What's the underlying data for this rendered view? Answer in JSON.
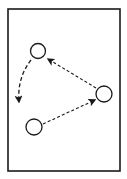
{
  "diagram": {
    "type": "cycle",
    "background": "#ffffff",
    "stroke_color": "#1a1a1a",
    "frame": {
      "x": 8,
      "y": 9,
      "width": 112,
      "height": 162,
      "stroke_width": 1.6
    },
    "nodes": [
      {
        "id": "node-top-left",
        "cx": 38,
        "cy": 51,
        "r": 7.5
      },
      {
        "id": "node-right",
        "cx": 104,
        "cy": 94,
        "r": 8
      },
      {
        "id": "node-bottom-left",
        "cx": 34,
        "cy": 127,
        "r": 8
      }
    ],
    "edges": [
      {
        "id": "edge-right-to-top-left",
        "from": "node-right",
        "to": "node-top-left",
        "style": "dashed",
        "curved": false
      },
      {
        "id": "edge-top-left-to-bottom-left",
        "from": "node-top-left",
        "to": "node-bottom-left",
        "style": "dashed",
        "curved": true
      },
      {
        "id": "edge-bottom-left-to-right",
        "from": "node-bottom-left",
        "to": "node-right",
        "style": "dashed",
        "curved": false
      }
    ]
  }
}
